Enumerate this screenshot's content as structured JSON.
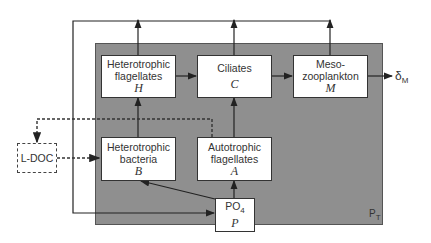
{
  "diagram": {
    "boundary_label": {
      "main": "P",
      "sub": "T"
    },
    "output_label": {
      "main": "δ",
      "sub": "M"
    },
    "nodes": {
      "hetero_flag": {
        "line1": "Heterotrophic",
        "line2": "flagellates",
        "symbol": "H"
      },
      "ciliates": {
        "line1": "Ciliates",
        "symbol": "C"
      },
      "meso": {
        "line1": "Meso-",
        "line2": "zooplankton",
        "symbol": "M"
      },
      "hetero_bact": {
        "line1": "Heterotrophic",
        "line2": "bacteria",
        "symbol": "B"
      },
      "auto_flag": {
        "line1": "Autotrophic",
        "line2": "flagellates",
        "symbol": "A"
      },
      "po4": {
        "main": "PO",
        "sub": "4",
        "symbol": "P"
      },
      "ldoc": {
        "label": "L-DOC"
      }
    },
    "edges": [
      {
        "from": "H",
        "to": "C",
        "style": "solid"
      },
      {
        "from": "C",
        "to": "M",
        "style": "solid"
      },
      {
        "from": "M",
        "to": "δM",
        "style": "solid"
      },
      {
        "from": "B",
        "to": "H",
        "style": "solid"
      },
      {
        "from": "A",
        "to": "C",
        "style": "solid"
      },
      {
        "from": "P",
        "to": "A",
        "style": "solid"
      },
      {
        "from": "P",
        "to": "B",
        "style": "solid"
      },
      {
        "from": "L-DOC",
        "to": "B",
        "style": "dashed"
      },
      {
        "from": "H,C,M (regeneration)",
        "to": "P",
        "style": "solid"
      },
      {
        "from": "B,A (exudation)",
        "to": "L-DOC",
        "style": "dashed"
      }
    ],
    "colors": {
      "pool_fill": "#8f8f8f",
      "box_fill": "#ffffff",
      "line": "#222222"
    }
  }
}
